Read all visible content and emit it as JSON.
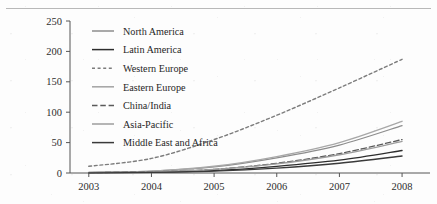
{
  "page": {
    "clipped_caption": "",
    "background_color": "#fdfdfd"
  },
  "chart_data": {
    "type": "line",
    "title": "",
    "xlabel": "",
    "ylabel": "",
    "x": [
      2003,
      2004,
      2005,
      2006,
      2007,
      2008
    ],
    "xtick_labels": [
      "2003",
      "2004",
      "2005",
      "2006",
      "2007",
      "2008"
    ],
    "ytick_labels": [
      "0",
      "50",
      "100",
      "150",
      "200",
      "250"
    ],
    "yticks": [
      0,
      50,
      100,
      150,
      200,
      250
    ],
    "xlim": [
      2002.7,
      2008.35
    ],
    "ylim": [
      0,
      250
    ],
    "grid": false,
    "legend_position": "upper-left-inside",
    "series": [
      {
        "name": "North America",
        "values": [
          1,
          3,
          10,
          25,
          46,
          78
        ],
        "color": "#8d8d8d",
        "style": "solid",
        "width": 1.3
      },
      {
        "name": "Latin America",
        "values": [
          0.5,
          1.5,
          4,
          11,
          21,
          37
        ],
        "color": "#2d2d2d",
        "style": "solid",
        "width": 1.3
      },
      {
        "name": "Western Europe",
        "values": [
          11,
          24,
          55,
          95,
          140,
          187
        ],
        "color": "#7c7c7c",
        "style": "dotted",
        "width": 1.4
      },
      {
        "name": "Eastern Europe",
        "values": [
          1,
          3,
          11,
          27,
          50,
          85
        ],
        "color": "#a8a8a8",
        "style": "solid",
        "width": 1.4
      },
      {
        "name": "China/India",
        "values": [
          0.5,
          2,
          6,
          16,
          32,
          55
        ],
        "color": "#5a5a5a",
        "style": "dashed",
        "width": 1.3
      },
      {
        "name": "Asia-Pacific",
        "values": [
          0.5,
          2,
          6,
          15,
          30,
          52
        ],
        "color": "#9c9c9c",
        "style": "solid",
        "width": 1.3
      },
      {
        "name": "Middle East and Africa",
        "values": [
          0.3,
          1,
          3,
          8,
          16,
          28
        ],
        "color": "#3a3a3a",
        "style": "solid",
        "width": 1.3
      }
    ]
  }
}
